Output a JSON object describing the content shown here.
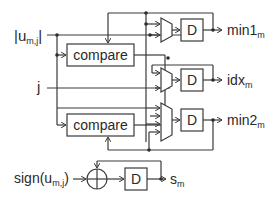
{
  "diagram": {
    "title": "",
    "colors": {
      "line": "#3a3a3a",
      "text": "#2a2a2a",
      "background": "#ffffff"
    },
    "inputs": {
      "u_abs": {
        "main": "|u",
        "sub": "m,j",
        "tail": "|"
      },
      "j": {
        "main": "j"
      },
      "sign": {
        "main": "sign(u",
        "sub": "m,j",
        "tail": ")"
      }
    },
    "blocks": {
      "compare1": "compare",
      "compare2": "compare",
      "reg_min1": "D",
      "reg_idx": "D",
      "reg_min2": "D",
      "reg_sign": "D",
      "xor": "xor-icon"
    },
    "outputs": {
      "min1": {
        "main": "min1",
        "sub": "m"
      },
      "idx": {
        "main": "idx",
        "sub": "m"
      },
      "min2": {
        "main": "min2",
        "sub": "m"
      },
      "s": {
        "main": "s",
        "sub": "m"
      }
    }
  }
}
